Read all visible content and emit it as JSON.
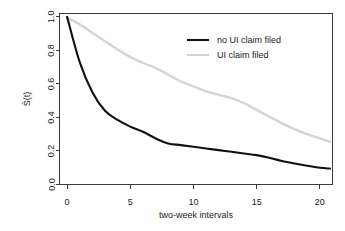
{
  "chart_data": {
    "type": "line",
    "title": "",
    "xlabel": "two-week intervals",
    "ylabel": "Ŝ(t)",
    "xlim": [
      -0.6,
      21.0
    ],
    "ylim": [
      0.0,
      1.02
    ],
    "grid": false,
    "legend_position": "top-right",
    "xticks": [
      0,
      5,
      10,
      15,
      20
    ],
    "xtick_labels": [
      "0",
      "5",
      "10",
      "15",
      "20"
    ],
    "yticks": [
      0.0,
      0.2,
      0.4,
      0.6,
      0.8,
      1.0
    ],
    "ytick_labels": [
      "0.0",
      "0.2",
      "0.4",
      "0.6",
      "0.8",
      "1.0"
    ],
    "x": [
      0,
      1,
      2,
      3,
      4,
      5,
      6,
      7,
      8,
      9,
      10,
      11,
      12,
      13,
      14,
      15,
      16,
      17,
      18,
      19,
      20,
      20.8
    ],
    "series": [
      {
        "name": "no UI claim filed",
        "color": "#111111",
        "width": 2.1,
        "values": [
          1.0,
          0.73,
          0.55,
          0.44,
          0.385,
          0.345,
          0.315,
          0.275,
          0.245,
          0.235,
          0.225,
          0.215,
          0.205,
          0.195,
          0.185,
          0.175,
          0.16,
          0.14,
          0.125,
          0.112,
          0.1,
          0.095
        ]
      },
      {
        "name": "UI claim filed",
        "color": "#d4d4d4",
        "width": 2.4,
        "values": [
          0.995,
          0.955,
          0.905,
          0.855,
          0.805,
          0.76,
          0.725,
          0.695,
          0.655,
          0.615,
          0.585,
          0.555,
          0.535,
          0.515,
          0.485,
          0.445,
          0.405,
          0.365,
          0.33,
          0.3,
          0.275,
          0.255
        ]
      }
    ]
  },
  "legend": {
    "entries": [
      {
        "label": "no UI claim filed",
        "color": "#111111"
      },
      {
        "label": "UI claim filed",
        "color": "#d4d4d4"
      }
    ]
  }
}
